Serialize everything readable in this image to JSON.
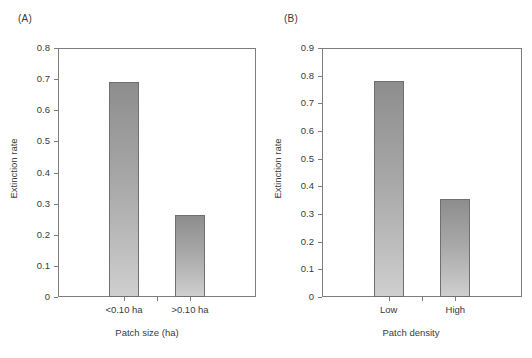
{
  "figure": {
    "background_color": "#ffffff",
    "bar_fill_top_color": "#8d8d8d",
    "bar_fill_bottom_color": "#cfcfcf",
    "bar_outline_color": "#6f6f6f",
    "axis_color": "#7d7d7d",
    "text_color": "#3a3a3a"
  },
  "panels": [
    {
      "letter": "(A)",
      "chart_data": {
        "type": "bar",
        "title": "",
        "categories": [
          "<0.10 ha",
          ">0.10 ha"
        ],
        "values": [
          0.69,
          0.263
        ],
        "xlabel": "Patch size (ha)",
        "ylabel": "Extinction rate",
        "ylim": [
          0,
          0.8
        ],
        "ytick_labels": [
          "0",
          "0.1",
          "0.2",
          "0.3",
          "0.4",
          "0.5",
          "0.6",
          "0.7",
          "0.8"
        ],
        "ytick_values": [
          0,
          0.1,
          0.2,
          0.3,
          0.4,
          0.5,
          0.6,
          0.7,
          0.8
        ],
        "grid": false,
        "legend": "none"
      }
    },
    {
      "letter": "(B)",
      "chart_data": {
        "type": "bar",
        "title": "",
        "categories": [
          "Low",
          "High"
        ],
        "values": [
          0.78,
          0.355
        ],
        "xlabel": "Patch density",
        "ylabel": "Extinction rate",
        "ylim": [
          0,
          0.9
        ],
        "ytick_labels": [
          "0",
          "0.1",
          "0.2",
          "0.3",
          "0.4",
          "0.5",
          "0.6",
          "0.7",
          "0.8",
          "0.9"
        ],
        "ytick_values": [
          0,
          0.1,
          0.2,
          0.3,
          0.4,
          0.5,
          0.6,
          0.7,
          0.8,
          0.9
        ],
        "grid": false,
        "legend": "none"
      }
    }
  ],
  "edge_caption_lines": [
    "",
    "",
    "",
    "",
    ""
  ]
}
